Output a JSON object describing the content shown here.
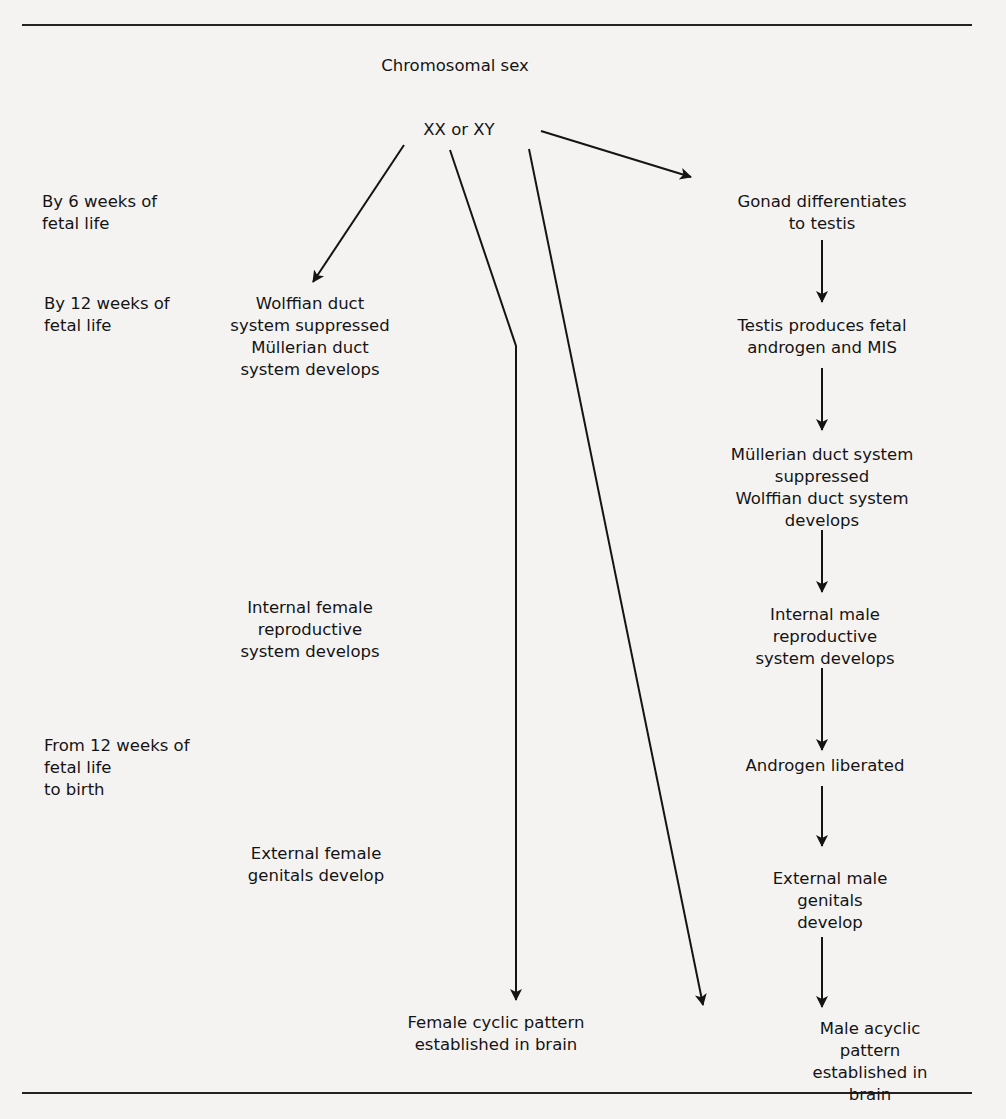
{
  "diagram": {
    "title": "Chromosomal sex",
    "root": "XX or XY",
    "timeline": [
      {
        "id": "t6",
        "label": "By 6 weeks of\nfetal life"
      },
      {
        "id": "t12",
        "label": "By 12 weeks of\nfetal life"
      },
      {
        "id": "tbirth",
        "label": "From 12 weeks of\nfetal life\nto birth"
      }
    ],
    "female_path": [
      {
        "id": "f1",
        "label": "Wolffian duct\nsystem suppressed\nMüllerian duct\nsystem develops"
      },
      {
        "id": "f2",
        "label": "Internal female\nreproductive\nsystem develops"
      },
      {
        "id": "f3",
        "label": "External female\ngenitals develop"
      },
      {
        "id": "f4",
        "label": "Female cyclic pattern\nestablished in brain"
      }
    ],
    "male_path": [
      {
        "id": "m1",
        "label": "Gonad differentiates\nto testis"
      },
      {
        "id": "m2",
        "label": "Testis produces fetal\nandrogen and MIS"
      },
      {
        "id": "m3",
        "label": "Müllerian duct system\nsuppressed\nWolffian duct system develops"
      },
      {
        "id": "m4",
        "label": "Internal male reproductive\nsystem develops"
      },
      {
        "id": "m5",
        "label": "Androgen liberated"
      },
      {
        "id": "m6",
        "label": "External male genitals\ndevelop"
      },
      {
        "id": "m7",
        "label": "Male acyclic pattern\nestablished in brain"
      }
    ],
    "colors": {
      "background": "#f4f3f1",
      "ink": "#141414"
    }
  }
}
